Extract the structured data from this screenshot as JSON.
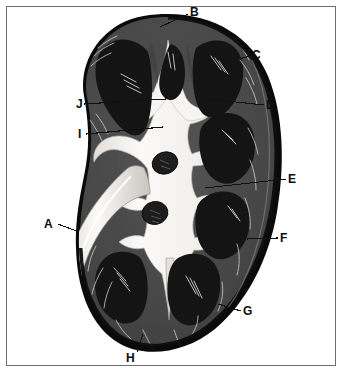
{
  "figure": {
    "kind": "anatomical-diagram",
    "background_color": "#ffffff",
    "frame_color": "#6e6e6e"
  },
  "colors": {
    "capsule_outer": "#0a0a0a",
    "cortex": "#4a4a4a",
    "cortex_light": "#585858",
    "medulla_pyramid": "#141414",
    "sinus_fat": "#f2f0ec",
    "pelvis_light": "#fbfaf8",
    "vessel_dark": "#1f1f1f",
    "outline": "#111111",
    "label_text": "#0d0d0d",
    "leader_line": "#111111"
  },
  "labels": [
    {
      "id": "A",
      "text": "A",
      "x": 44,
      "y": 218,
      "leader": {
        "x1": 58,
        "y1": 224,
        "x2": 79,
        "y2": 232
      }
    },
    {
      "id": "B",
      "text": "B",
      "x": 190,
      "y": 6,
      "leader": {
        "x1": 188,
        "y1": 14,
        "x2": 160,
        "y2": 27
      }
    },
    {
      "id": "C",
      "text": "C",
      "x": 252,
      "y": 49,
      "leader": {
        "x1": 250,
        "y1": 56,
        "x2": 228,
        "y2": 62
      }
    },
    {
      "id": "D",
      "text": "D",
      "x": 266,
      "y": 99,
      "leader": {
        "x1": 264,
        "y1": 105,
        "x2": 208,
        "y2": 99
      }
    },
    {
      "id": "E",
      "text": "E",
      "x": 288,
      "y": 173,
      "leader": {
        "x1": 286,
        "y1": 179,
        "x2": 205,
        "y2": 188
      }
    },
    {
      "id": "F",
      "text": "F",
      "x": 280,
      "y": 232,
      "leader": {
        "x1": 278,
        "y1": 238,
        "x2": 247,
        "y2": 239
      }
    },
    {
      "id": "G",
      "text": "G",
      "x": 243,
      "y": 305,
      "leader": {
        "x1": 241,
        "y1": 311,
        "x2": 218,
        "y2": 304
      }
    },
    {
      "id": "H",
      "text": "H",
      "x": 126,
      "y": 352,
      "leader": {
        "x1": 137,
        "y1": 352,
        "x2": 143,
        "y2": 334
      }
    },
    {
      "id": "I",
      "text": "I",
      "x": 78,
      "y": 128,
      "leader": {
        "x1": 86,
        "y1": 134,
        "x2": 163,
        "y2": 127
      }
    },
    {
      "id": "J",
      "text": "J",
      "x": 76,
      "y": 98,
      "leader": {
        "x1": 84,
        "y1": 104,
        "x2": 166,
        "y2": 99
      }
    }
  ],
  "structures": [
    {
      "name": "renal-capsule",
      "label_ref": "G"
    },
    {
      "name": "renal-cortex",
      "label_ref": "C"
    },
    {
      "name": "renal-column",
      "label_ref": "D"
    },
    {
      "name": "renal-pyramid",
      "label_ref": "E"
    },
    {
      "name": "renal-medulla",
      "label_ref": "F"
    },
    {
      "name": "minor-calyx",
      "label_ref": "B"
    },
    {
      "name": "major-calyx",
      "label_ref": "J"
    },
    {
      "name": "renal-pelvis",
      "label_ref": "I"
    },
    {
      "name": "ureter",
      "label_ref": "A"
    },
    {
      "name": "renal-papilla",
      "label_ref": "H"
    }
  ]
}
